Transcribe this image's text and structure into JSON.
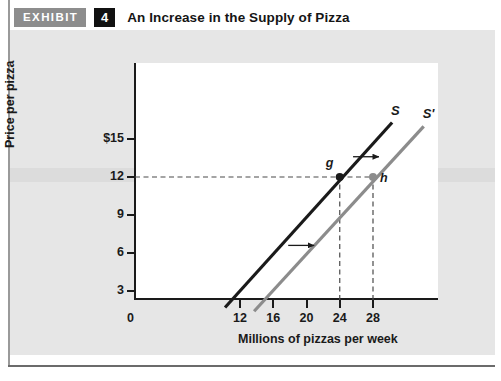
{
  "exhibit": {
    "tag": "EXHIBIT",
    "number": "4",
    "title": "An Increase in the Supply of Pizza"
  },
  "chart_data": {
    "type": "line",
    "title": "An Increase in the Supply of Pizza",
    "xlabel": "Millions of pizzas per week",
    "ylabel": "Price per pizza",
    "xlim": [
      0,
      32
    ],
    "ylim": [
      0,
      16.5
    ],
    "xticks": [
      12,
      16,
      20,
      24,
      28
    ],
    "xtick_labels": [
      "12",
      "16",
      "20",
      "24",
      "28"
    ],
    "origin_label": "0",
    "yticks": [
      3,
      6,
      9,
      12,
      15
    ],
    "ytick_labels": [
      "3",
      "6",
      "9",
      "12",
      "$15"
    ],
    "grid": false,
    "legend": "none",
    "series": [
      {
        "name": "S",
        "label": "S",
        "color": "#1a1a1a",
        "x": [
          10.2,
          30.3
        ],
        "y": [
          1.7,
          16.3
        ]
      },
      {
        "name": "S'",
        "label": "S'",
        "color": "#8c8c8c",
        "x": [
          13.7,
          34.1
        ],
        "y": [
          1.4,
          16.0
        ]
      }
    ],
    "points": [
      {
        "label": "g",
        "x": 24,
        "y": 12,
        "color": "#1a1a1a"
      },
      {
        "label": "h",
        "x": 28,
        "y": 12,
        "color": "#8c8c8c"
      }
    ],
    "dashed_guides": [
      {
        "type": "horizontal",
        "value": 12,
        "from_x": 0,
        "to_x": 28
      },
      {
        "type": "vertical",
        "value": 24,
        "from_y": 0,
        "to_y": 12
      },
      {
        "type": "vertical",
        "value": 28,
        "from_y": 0,
        "to_y": 12
      }
    ],
    "annotations": [
      {
        "name": "shift-arrow-upper",
        "type": "arrow",
        "direction": "right",
        "x_start": 25.6,
        "x_end": 29.2,
        "y": 13.6
      },
      {
        "name": "shift-arrow-lower",
        "type": "arrow",
        "direction": "right",
        "x_start": 17.8,
        "x_end": 21.4,
        "y": 6.6
      }
    ]
  }
}
